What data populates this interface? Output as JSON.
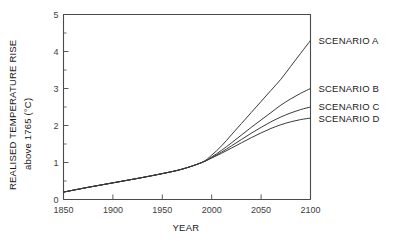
{
  "chart_data": {
    "type": "line",
    "title": "",
    "xlabel": "YEAR",
    "ylabel": "REALISED TEMPERATURE RISE",
    "ylabel_line2": "above 1765 (°C)",
    "xlim": [
      1850,
      2100
    ],
    "ylim": [
      0,
      5
    ],
    "xticks": [
      1850,
      1900,
      1950,
      2000,
      2050,
      2100
    ],
    "xticklabels": [
      "1850",
      "1900",
      "1950",
      "2000",
      "2050",
      "2100"
    ],
    "yticks": [
      0,
      1,
      2,
      3,
      4,
      5
    ],
    "yticklabels": [
      "0",
      "1",
      "2",
      "3",
      "4",
      "5"
    ],
    "y_minor_ticks": [
      0.5,
      1.5,
      2.5,
      3.5,
      4.5
    ],
    "grid": false,
    "legend_position": "right-inline",
    "line_color": "#3a3a3a",
    "axis_color": "#4a4a4a",
    "series": [
      {
        "name": "SCENARIO A",
        "label": "SCENARIO A",
        "label_year": 2100,
        "label_value": 4.3,
        "x": [
          1850,
          1875,
          1900,
          1925,
          1950,
          1970,
          1990,
          2000,
          2010,
          2020,
          2030,
          2040,
          2050,
          2060,
          2070,
          2080,
          2090,
          2100
        ],
        "values": [
          0.2,
          0.33,
          0.45,
          0.57,
          0.7,
          0.82,
          1.0,
          1.2,
          1.45,
          1.75,
          2.05,
          2.35,
          2.65,
          2.95,
          3.25,
          3.6,
          3.95,
          4.3
        ]
      },
      {
        "name": "SCENARIO B",
        "label": "SCENARIO B",
        "label_year": 2100,
        "label_value": 3.0,
        "x": [
          1850,
          1875,
          1900,
          1925,
          1950,
          1970,
          1990,
          2000,
          2010,
          2020,
          2030,
          2040,
          2050,
          2060,
          2070,
          2080,
          2090,
          2100
        ],
        "values": [
          0.2,
          0.33,
          0.45,
          0.57,
          0.7,
          0.82,
          1.0,
          1.15,
          1.33,
          1.53,
          1.74,
          1.95,
          2.15,
          2.35,
          2.55,
          2.72,
          2.87,
          3.0
        ]
      },
      {
        "name": "SCENARIO C",
        "label": "SCENARIO C",
        "label_year": 2100,
        "label_value": 2.5,
        "x": [
          1850,
          1875,
          1900,
          1925,
          1950,
          1970,
          1990,
          2000,
          2010,
          2020,
          2030,
          2040,
          2050,
          2060,
          2070,
          2080,
          2090,
          2100
        ],
        "values": [
          0.2,
          0.33,
          0.45,
          0.57,
          0.7,
          0.82,
          1.0,
          1.13,
          1.28,
          1.45,
          1.62,
          1.79,
          1.95,
          2.1,
          2.23,
          2.34,
          2.43,
          2.5
        ]
      },
      {
        "name": "SCENARIO D",
        "label": "SCENARIO D",
        "label_year": 2100,
        "label_value": 2.2,
        "x": [
          1850,
          1875,
          1900,
          1925,
          1950,
          1970,
          1990,
          2000,
          2010,
          2020,
          2030,
          2040,
          2050,
          2060,
          2070,
          2080,
          2090,
          2100
        ],
        "values": [
          0.2,
          0.33,
          0.45,
          0.57,
          0.7,
          0.82,
          1.0,
          1.12,
          1.25,
          1.39,
          1.53,
          1.67,
          1.8,
          1.92,
          2.02,
          2.1,
          2.16,
          2.2
        ]
      }
    ]
  }
}
